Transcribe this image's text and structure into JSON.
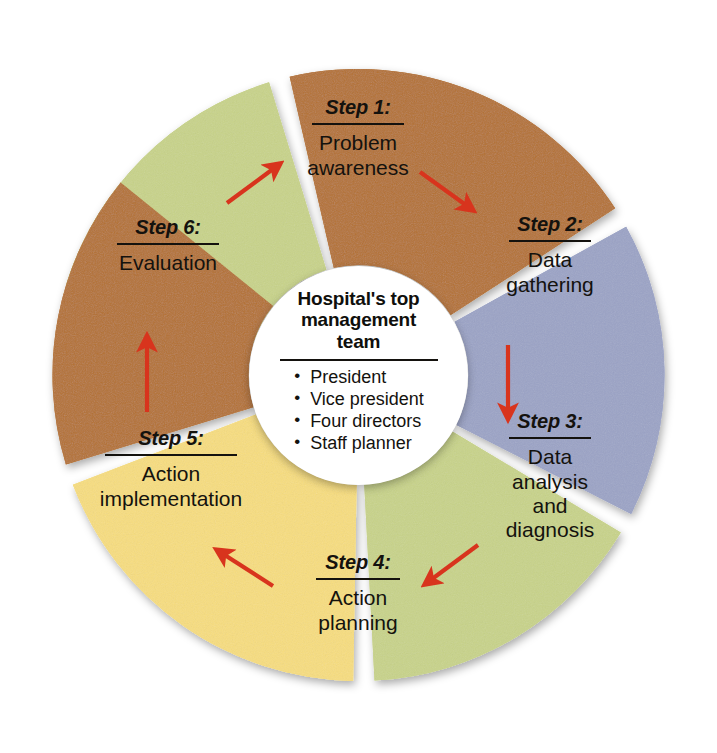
{
  "diagram": {
    "center": {
      "heading": "Hospital's top\nmanagement\nteam",
      "members": [
        "President",
        "Vice president",
        "Four directors",
        "Staff planner"
      ]
    },
    "colors": {
      "green": "#c8d389",
      "brown": "#b4712f",
      "lavender": "#9ba3c6",
      "yellow": "#f7dd7e",
      "arrow": "#d8341d",
      "text": "#14120e",
      "background": "#ffffff"
    },
    "segments": [
      {
        "step": "Step 1:",
        "body": "Problem\nawareness",
        "color": "#c8d389",
        "start_angle": -73,
        "end_angle": -17
      },
      {
        "step": "Step 2:",
        "body": "Data\ngathering",
        "color": "#b4712f",
        "start_angle": -13,
        "end_angle": 57
      },
      {
        "step": "Step 3:",
        "body": "Data\nanalysis\nand\ndiagnosis",
        "color": "#9ba3c6",
        "start_angle": 61,
        "end_angle": 117
      },
      {
        "step": "Step 4:",
        "body": "Action\nplanning",
        "color": "#c8d389",
        "start_angle": 121,
        "end_angle": 177
      },
      {
        "step": "Step 5:",
        "body": "Action\nimplementation",
        "color": "#f7dd7e",
        "start_angle": 181,
        "end_angle": 249
      },
      {
        "step": "Step 6:",
        "body": "Evaluation",
        "color": "#b4712f",
        "start_angle": 253,
        "end_angle": 309
      }
    ],
    "arrows": [
      {
        "name": "arrow-step1-to-step2",
        "x1": 420,
        "y1": 172,
        "x2": 470,
        "y2": 208
      },
      {
        "name": "arrow-step2-to-step3",
        "x1": 508,
        "y1": 345,
        "x2": 508,
        "y2": 415
      },
      {
        "name": "arrow-step3-to-step4",
        "x1": 478,
        "y1": 545,
        "x2": 428,
        "y2": 582
      },
      {
        "name": "arrow-step4-to-step5",
        "x1": 273,
        "y1": 586,
        "x2": 220,
        "y2": 552
      },
      {
        "name": "arrow-step5-to-step6",
        "x1": 147,
        "y1": 412,
        "x2": 147,
        "y2": 340
      },
      {
        "name": "arrow-step6-to-step1",
        "x1": 227,
        "y1": 203,
        "x2": 277,
        "y2": 166
      }
    ]
  }
}
